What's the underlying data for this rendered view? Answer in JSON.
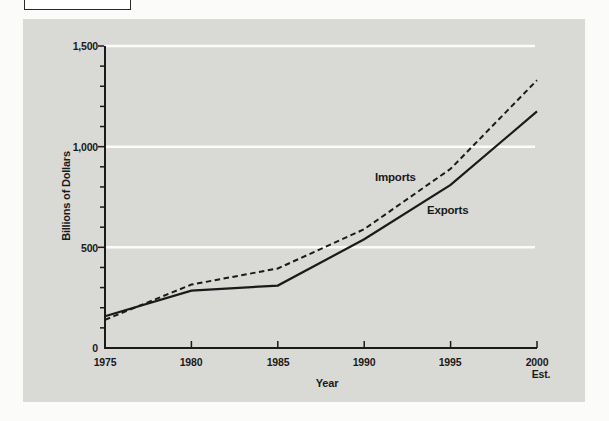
{
  "chart": {
    "y_axis": {
      "title": "Billions of Dollars",
      "tick_labels": [
        "1,500",
        "1,000",
        "500",
        "0"
      ]
    },
    "x_axis": {
      "title": "Year",
      "tick_labels": [
        "1975",
        "1980",
        "1985",
        "1990",
        "1995",
        "2000"
      ],
      "est_note": "Est."
    }
  },
  "chart_data": {
    "type": "line",
    "title": "",
    "xlabel": "Year",
    "ylabel": "Billions of Dollars",
    "x": [
      1975,
      1980,
      1985,
      1990,
      1995,
      2000
    ],
    "series": [
      {
        "name": "Imports",
        "line_style": "dashed",
        "values": [
          140,
          315,
          395,
          590,
          890,
          1330
        ]
      },
      {
        "name": "Exports",
        "line_style": "solid",
        "values": [
          158,
          285,
          310,
          540,
          810,
          1175
        ]
      }
    ],
    "xlim": [
      1975,
      2000
    ],
    "ylim": [
      0,
      1500
    ],
    "y_major_ticks": [
      0,
      500,
      1000,
      1500
    ],
    "y_minor_tick_step": 100,
    "x_note": "2000 values are estimates (Est.)",
    "grid": "white horizontal gridlines at 500, 1000 and 1500",
    "legend": "inline labels beside each line"
  },
  "colors": {
    "page_background": "#fbfbf9",
    "panel_background": "#d9d9d6",
    "line": "#1a1a1a",
    "gridline": "#fbfbf9"
  }
}
